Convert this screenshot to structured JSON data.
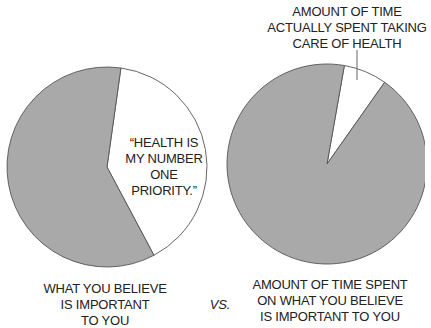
{
  "colors": {
    "gray_slice": "#a9a9a9",
    "white_slice": "#ffffff",
    "outline": "#555555"
  },
  "chart_data": [
    {
      "type": "pie",
      "caption": "WHAT YOU BELIEVE\nIS IMPORTANT\nTO YOU",
      "slices": [
        {
          "name": "health",
          "label": "“HEALTH IS\nMY NUMBER\nONE PRIORITY.”",
          "value": 40,
          "color": "#ffffff"
        },
        {
          "name": "other",
          "label": "",
          "value": 60,
          "color": "#a9a9a9"
        }
      ],
      "start_angle_deg": 8
    },
    {
      "type": "pie",
      "caption": "AMOUNT OF TIME SPENT\nON WHAT YOU BELIEVE\nIS IMPORTANT TO YOU",
      "slices": [
        {
          "name": "health",
          "label": "AMOUNT OF TIME\nACTUALLY SPENT TAKING\nCARE OF HEALTH",
          "value": 7,
          "color": "#ffffff"
        },
        {
          "name": "other",
          "label": "",
          "value": 93,
          "color": "#a9a9a9"
        }
      ],
      "start_angle_deg": 10
    }
  ],
  "separator_label": "VS."
}
